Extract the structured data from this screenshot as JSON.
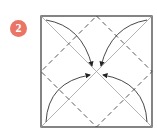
{
  "step": {
    "number": "2",
    "badge_color": "#ea7466"
  },
  "diagram": {
    "square": {
      "x": 41,
      "y": 16,
      "size": 111
    },
    "line_colors": {
      "border": "#333333",
      "diagonal": "#999999",
      "dashed": "#444444",
      "arrow": "#333333"
    }
  }
}
